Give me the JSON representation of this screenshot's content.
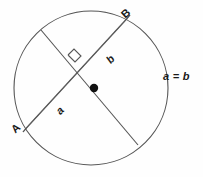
{
  "diagram": {
    "type": "geometry-circle-chord",
    "background_color": "#fefefe",
    "stroke_color": "#4a4a4a",
    "text_color": "#1a1a1a",
    "canvas": {
      "width": 203,
      "height": 177
    },
    "circle": {
      "name": "main-circle",
      "center_x": 91,
      "center_y": 88,
      "radius": 77,
      "stroke_color": "#555555",
      "stroke_width": 1,
      "fill": "none"
    },
    "center_point": {
      "name": "circle-center-dot",
      "x": 94,
      "y": 88,
      "radius": 4,
      "fill_color": "#111111"
    },
    "chord": {
      "name": "chord-ab",
      "style": "double-line",
      "x1": 25,
      "y1": 130,
      "x2": 128,
      "y2": 18,
      "offset": 3,
      "endpoint_labels": [
        "A",
        "B"
      ],
      "segment_labels": [
        "a",
        "b"
      ]
    },
    "diameter": {
      "name": "perpendicular-diameter",
      "x1": 41,
      "y1": 30,
      "x2": 138,
      "y2": 145
    },
    "right_angle": {
      "name": "right-angle-marker",
      "x": 74,
      "y": 58,
      "size": 9
    },
    "labels": {
      "point_a": "A",
      "point_b": "B",
      "segment_a": "a",
      "segment_b": "b",
      "equation": "a = b"
    }
  }
}
